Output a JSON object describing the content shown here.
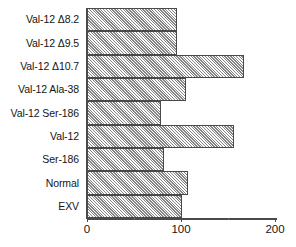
{
  "chart_data": {
    "type": "bar",
    "orientation": "horizontal",
    "title": "",
    "xlabel": "",
    "ylabel": "",
    "xlim": [
      0,
      200
    ],
    "xticks": [
      0,
      100,
      200
    ],
    "xticklabels": [
      "0",
      "100",
      "200"
    ],
    "grid": false,
    "legend": false,
    "categories": [
      "Val-12 Δ8.2",
      "Val-12 Δ9.5",
      "Val-12 Δ10.7",
      "Val-12 Ala-38",
      "Val-12 Ser-186",
      "Val-12",
      "Ser-186",
      "Normal",
      "EXV"
    ],
    "values": [
      95,
      95,
      166,
      105,
      78,
      156,
      81,
      107,
      100
    ],
    "bar_style": {
      "fill": "#c8c8c8",
      "hatch": "crosshatch",
      "edge": "#4a4a4a"
    }
  },
  "axis": {
    "tick_labels": [
      "0",
      "100",
      "200"
    ],
    "minor_ticks": [
      50,
      150
    ]
  }
}
